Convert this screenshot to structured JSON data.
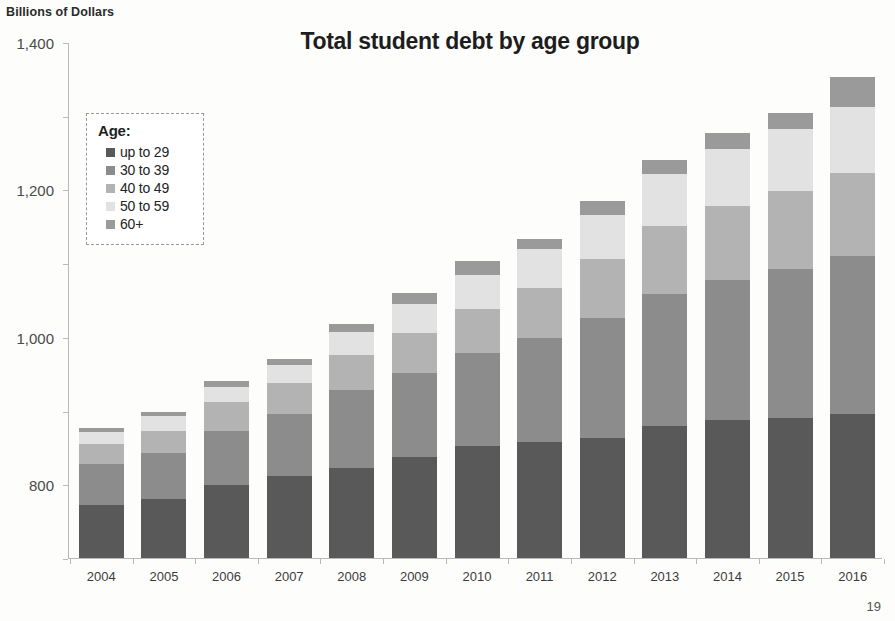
{
  "axis_unit_caption": "Billions of Dollars",
  "page_number": "19",
  "legend": {
    "title": "Age:",
    "items": [
      {
        "label": "up to 29",
        "color": "#595959"
      },
      {
        "label": "30 to 39",
        "color": "#8c8c8c"
      },
      {
        "label": "40 to 49",
        "color": "#b3b3b3"
      },
      {
        "label": "50 to 59",
        "color": "#e2e2e2"
      },
      {
        "label": "60+",
        "color": "#9a9a9a"
      }
    ]
  },
  "chart_data": {
    "type": "bar",
    "stacked": true,
    "title": "Total student debt by age group",
    "xlabel": "",
    "ylabel": "Billions of Dollars",
    "ylim": [
      0,
      1400
    ],
    "yticks": [
      0,
      200,
      400,
      600,
      800,
      1000,
      1200,
      1400
    ],
    "ytick_labels": [
      "0",
      "200",
      "400",
      "600",
      "800",
      "1,000",
      "1,200",
      "1,400"
    ],
    "grid": false,
    "legend_position": "inside-upper-left",
    "categories": [
      "2004",
      "2005",
      "2006",
      "2007",
      "2008",
      "2009",
      "2010",
      "2011",
      "2012",
      "2013",
      "2014",
      "2015",
      "2016"
    ],
    "series": [
      {
        "name": "up to 29",
        "color": "#595959",
        "values": [
          145,
          160,
          197,
          222,
          245,
          275,
          305,
          315,
          325,
          358,
          375,
          380,
          390
        ]
      },
      {
        "name": "30 to 39",
        "color": "#8c8c8c",
        "values": [
          110,
          125,
          148,
          168,
          210,
          228,
          250,
          283,
          325,
          358,
          380,
          405,
          430
        ]
      },
      {
        "name": "40 to 49",
        "color": "#b3b3b3",
        "values": [
          55,
          60,
          78,
          85,
          95,
          108,
          120,
          135,
          160,
          185,
          200,
          210,
          225
        ]
      },
      {
        "name": "50 to 59",
        "color": "#e2e2e2",
        "values": [
          32,
          40,
          42,
          48,
          62,
          78,
          92,
          105,
          120,
          140,
          155,
          168,
          180
        ]
      },
      {
        "name": "60+",
        "color": "#9a9a9a",
        "values": [
          10,
          12,
          15,
          17,
          22,
          30,
          38,
          28,
          40,
          38,
          42,
          45,
          80
        ]
      }
    ],
    "totals": [
      352,
      397,
      480,
      540,
      634,
      719,
      805,
      866,
      970,
      1079,
      1152,
      1208,
      1305
    ]
  }
}
